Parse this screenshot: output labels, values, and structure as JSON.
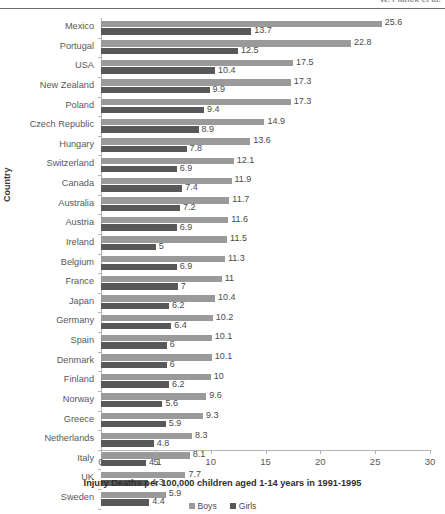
{
  "page": {
    "running_head": "W. Planck et al."
  },
  "chart_data": {
    "type": "bar",
    "orientation": "horizontal",
    "title": "",
    "xlabel": "Injury Deaths per 100,000 children aged 1-14 years in 1991-1995",
    "ylabel": "Country",
    "xlim": [
      0,
      30
    ],
    "xticks": [
      0,
      5,
      10,
      15,
      20,
      25,
      30
    ],
    "grid": false,
    "legend_position": "bottom",
    "categories": [
      "Mexico",
      "Portugal",
      "USA",
      "New Zealand",
      "Poland",
      "Czech Republic",
      "Hungary",
      "Switzerland",
      "Canada",
      "Australia",
      "Austria",
      "Ireland",
      "Belgium",
      "France",
      "Japan",
      "Germany",
      "Spain",
      "Denmark",
      "Finland",
      "Norway",
      "Greece",
      "Netherlands",
      "Italy",
      "UK",
      "Sweden"
    ],
    "series": [
      {
        "name": "Boys",
        "color": "#9a9a9a",
        "values": [
          25.6,
          22.8,
          17.5,
          17.3,
          17.3,
          14.9,
          13.6,
          12.1,
          11.9,
          11.7,
          11.6,
          11.5,
          11.3,
          11,
          10.4,
          10.2,
          10.1,
          10.1,
          10,
          9.6,
          9.3,
          8.3,
          8.1,
          7.7,
          5.9
        ],
        "labels": [
          "25.6",
          "22.8",
          "17.5",
          "17.3",
          "17.3",
          "14.9",
          "13.6",
          "12.1",
          "11.9",
          "11.7",
          "11.6",
          "11.5",
          "11.3",
          "11",
          "10.4",
          "10.2",
          "10.1",
          "10.1",
          "10",
          "9.6",
          "9.3",
          "8.3",
          "8.1",
          "7.7",
          "5.9"
        ]
      },
      {
        "name": "Girls",
        "color": "#585858",
        "values": [
          13.7,
          12.5,
          10.4,
          9.9,
          9.4,
          8.9,
          7.8,
          6.9,
          7.4,
          7.2,
          6.9,
          5,
          6.9,
          7,
          6.2,
          6.4,
          6,
          6,
          6.2,
          5.6,
          5.9,
          4.8,
          4.1,
          4.3,
          4.4
        ],
        "labels": [
          "13.7",
          "12.5",
          "10.4",
          "9.9",
          "9.4",
          "8.9",
          "7.8",
          "6.9",
          "7.4",
          "7.2",
          "6.9",
          "5",
          "6.9",
          "7",
          "6.2",
          "6.4",
          "6",
          "6",
          "6.2",
          "5.6",
          "5.9",
          "4.8",
          "4.1",
          "4.3",
          "4.4"
        ]
      }
    ]
  }
}
